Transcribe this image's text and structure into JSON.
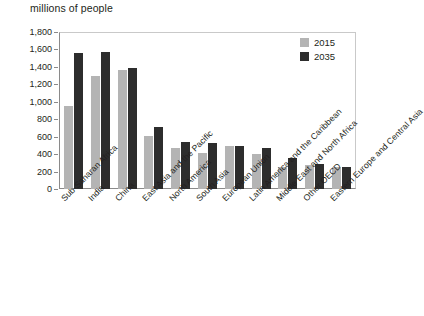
{
  "chart_data": {
    "type": "bar",
    "title": "millions of people",
    "xlabel": "",
    "ylabel": "millions of people",
    "ylim": [
      0,
      1800
    ],
    "ytick_step": 200,
    "grid": false,
    "legend_position": "top-right",
    "categories": [
      "Sub-Saharan Africa",
      "India",
      "China",
      "East Asia and the Pacific",
      "North America",
      "South Asia",
      "European Union",
      "Latin America and the Caribbean",
      "Middle East and North Africa",
      "Other OECD",
      "Eastern Europe and Central Asia"
    ],
    "ytick_labels": [
      "1,800",
      "1,600",
      "1,400",
      "1,200",
      "1,000",
      "800",
      "600",
      "400",
      "200",
      "0"
    ],
    "ytick_values": [
      1800,
      1600,
      1400,
      1200,
      1000,
      800,
      600,
      400,
      200,
      0
    ],
    "series": [
      {
        "name": "2015",
        "color": "#b4b4b4",
        "values": [
          955,
          1300,
          1365,
          605,
          465,
          410,
          490,
          405,
          255,
          275,
          255
        ]
      },
      {
        "name": "2035",
        "color": "#2d2d2d",
        "values": [
          1560,
          1575,
          1390,
          710,
          535,
          530,
          490,
          470,
          355,
          290,
          255
        ]
      }
    ]
  },
  "legend": {
    "items": [
      {
        "label": "2015",
        "color": "#b4b4b4"
      },
      {
        "label": "2035",
        "color": "#2d2d2d"
      }
    ]
  },
  "colors": {
    "series_2015": "#b4b4b4",
    "series_2035": "#2d2d2d",
    "axis": "#8a8a8a",
    "frame": "#c9c9c9",
    "text": "#231f20",
    "background": "#ffffff"
  }
}
